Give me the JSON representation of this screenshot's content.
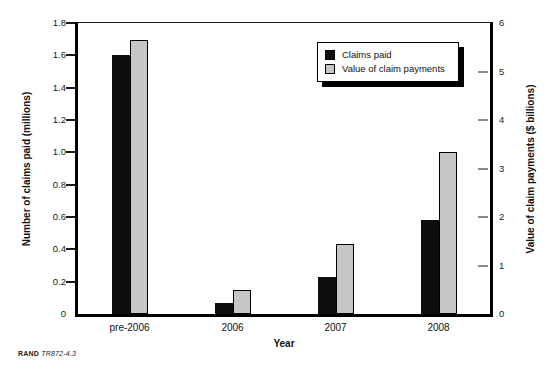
{
  "chart_data": {
    "type": "bar",
    "title": "",
    "categories": [
      "pre-2006",
      "2006",
      "2007",
      "2008"
    ],
    "series": [
      {
        "name": "Claims paid",
        "axis": "left",
        "color": "#0e0e0e",
        "values": [
          1.6,
          0.07,
          0.23,
          0.58
        ]
      },
      {
        "name": "Value of claim payments",
        "axis": "right",
        "color": "#c6c6c6",
        "values": [
          5.65,
          0.5,
          1.45,
          3.35
        ]
      }
    ],
    "xlabel": "Year",
    "ylabel_left": "Number of claims paid (millions)",
    "ylabel_right": "Value of claim payments ($ billions)",
    "ylim_left": [
      0,
      1.8
    ],
    "ylim_right": [
      0,
      6
    ],
    "yticks_left": [
      {
        "v": 0,
        "label": "0"
      },
      {
        "v": 0.2,
        "label": "0.2"
      },
      {
        "v": 0.4,
        "label": "0.4"
      },
      {
        "v": 0.6,
        "label": "0.6"
      },
      {
        "v": 0.8,
        "label": "0.8"
      },
      {
        "v": 1.0,
        "label": "1.0"
      },
      {
        "v": 1.2,
        "label": "1.2"
      },
      {
        "v": 1.4,
        "label": "1.4"
      },
      {
        "v": 1.6,
        "label": "1.6"
      },
      {
        "v": 1.8,
        "label": "1.8"
      }
    ],
    "yticks_right": [
      {
        "v": 0,
        "label": "0"
      },
      {
        "v": 1,
        "label": "1"
      },
      {
        "v": 2,
        "label": "2"
      },
      {
        "v": 3,
        "label": "3"
      },
      {
        "v": 4,
        "label": "4"
      },
      {
        "v": 5,
        "label": "5"
      },
      {
        "v": 6,
        "label": "6"
      }
    ],
    "grid": false,
    "legend_position": "top-right"
  },
  "footer": {
    "brand": "RAND",
    "figure_id": "TR872-4.3"
  }
}
